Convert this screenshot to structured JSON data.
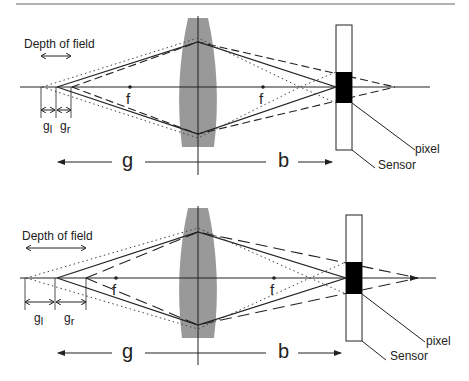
{
  "figure": {
    "top_diagram": {
      "depth_of_field_label": "Depth of field",
      "focal_label_left": "f",
      "focal_label_right": "f",
      "near_limit_label": "g",
      "near_limit_subscript": "l",
      "far_limit_label": "g",
      "far_limit_subscript": "r",
      "object_distance_label": "g",
      "image_distance_label": "b",
      "pixel_label": "pixel",
      "sensor_label": "Sensor"
    },
    "bottom_diagram": {
      "depth_of_field_label": "Depth of field",
      "focal_label_left": "f",
      "focal_label_right": "f",
      "near_limit_label": "g",
      "near_limit_subscript": "l",
      "far_limit_label": "g",
      "far_limit_subscript": "r",
      "object_distance_label": "g",
      "image_distance_label": "b",
      "pixel_label": "pixel",
      "sensor_label": "Sensor"
    },
    "colors": {
      "line": "#222222",
      "lens": "#999999",
      "pixel": "#000000"
    }
  }
}
